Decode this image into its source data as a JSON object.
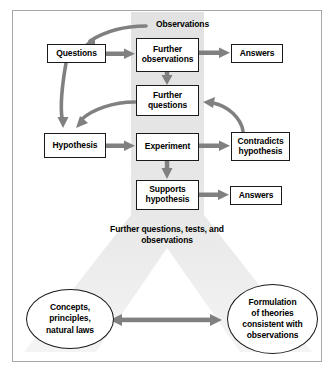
{
  "diagram": {
    "title_label": "Observations",
    "center_text_lines": [
      "Further",
      "questions, tests,",
      "and observations"
    ],
    "nodes": {
      "questions": "Questions",
      "further_observations_l1": "Further",
      "further_observations_l2": "observations",
      "answers_top": "Answers",
      "further_questions_l1": "Further",
      "further_questions_l2": "questions",
      "hypothesis": "Hypothesis",
      "experiment": "Experiment",
      "contradicts_l1": "Contradicts",
      "contradicts_l2": "hypothesis",
      "supports_l1": "Supports",
      "supports_l2": "hypothesis",
      "answers_bottom": "Answers"
    },
    "ellipses": {
      "left_l1": "Concepts,",
      "left_l2": "principles,",
      "left_l3": "natural laws",
      "right_l1": "Formulation",
      "right_l2": "of theories",
      "right_l3": "consistent with",
      "right_l4": "observations"
    },
    "colors": {
      "arrow": "#808080",
      "band": "#e4e4e4",
      "frame": "#a8a8a8",
      "node_border": "#1a1a1a",
      "text": "#000000",
      "shadow": "#b4b4b4"
    }
  }
}
